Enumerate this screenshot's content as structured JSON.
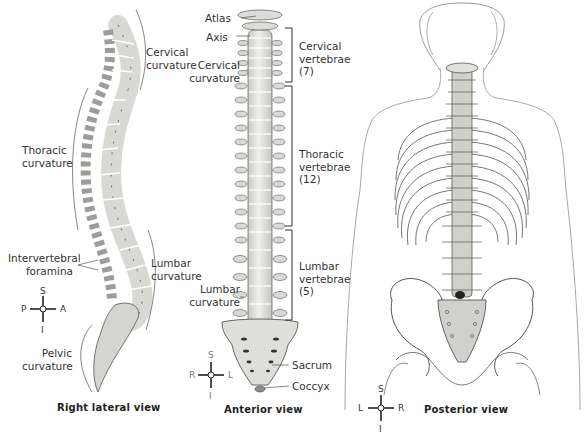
{
  "figure": {
    "panels": [
      {
        "id": "right-lateral",
        "caption": "Right lateral view",
        "labels": {
          "cervical_curvature_1": "Cervical",
          "cervical_curvature_2": "curvature",
          "thoracic_curvature_1": "Thoracic",
          "thoracic_curvature_2": "curvature",
          "intervertebral_foramina_1": "Intervertebral",
          "intervertebral_foramina_2": "foramina",
          "lumbar_curvature_1": "Lumbar",
          "lumbar_curvature_2": "curvature",
          "pelvic_curvature_1": "Pelvic",
          "pelvic_curvature_2": "curvature"
        },
        "compass": {
          "top": "S",
          "bottom": "I",
          "left": "P",
          "right": "A"
        }
      },
      {
        "id": "anterior",
        "caption": "Anterior view",
        "labels": {
          "atlas": "Atlas",
          "axis": "Axis",
          "cervical_curvature_1": "Cervical",
          "cervical_curvature_2": "curvature",
          "lumbar_curvature_1": "Lumbar",
          "lumbar_curvature_2": "curvature",
          "sacrum": "Sacrum",
          "coccyx": "Coccyx"
        },
        "brackets": [
          {
            "line1": "Cervical",
            "line2": "vertebrae",
            "count": "(7)"
          },
          {
            "line1": "Thoracic",
            "line2": "vertebrae",
            "count": "(12)"
          },
          {
            "line1": "Lumbar",
            "line2": "vertebrae",
            "count": "(5)"
          }
        ],
        "compass": {
          "top": "S",
          "bottom": "I",
          "left": "R",
          "right": "L"
        }
      },
      {
        "id": "posterior",
        "caption": "Posterior view",
        "compass": {
          "top": "S",
          "bottom": "I",
          "left": "L",
          "right": "R"
        }
      }
    ]
  },
  "colors": {
    "bone": "#e6e6e2",
    "bone_shadow": "#b9b9b4",
    "outline": "#4a4a48",
    "body_outline": "#9a9a9a",
    "text": "#333333"
  }
}
